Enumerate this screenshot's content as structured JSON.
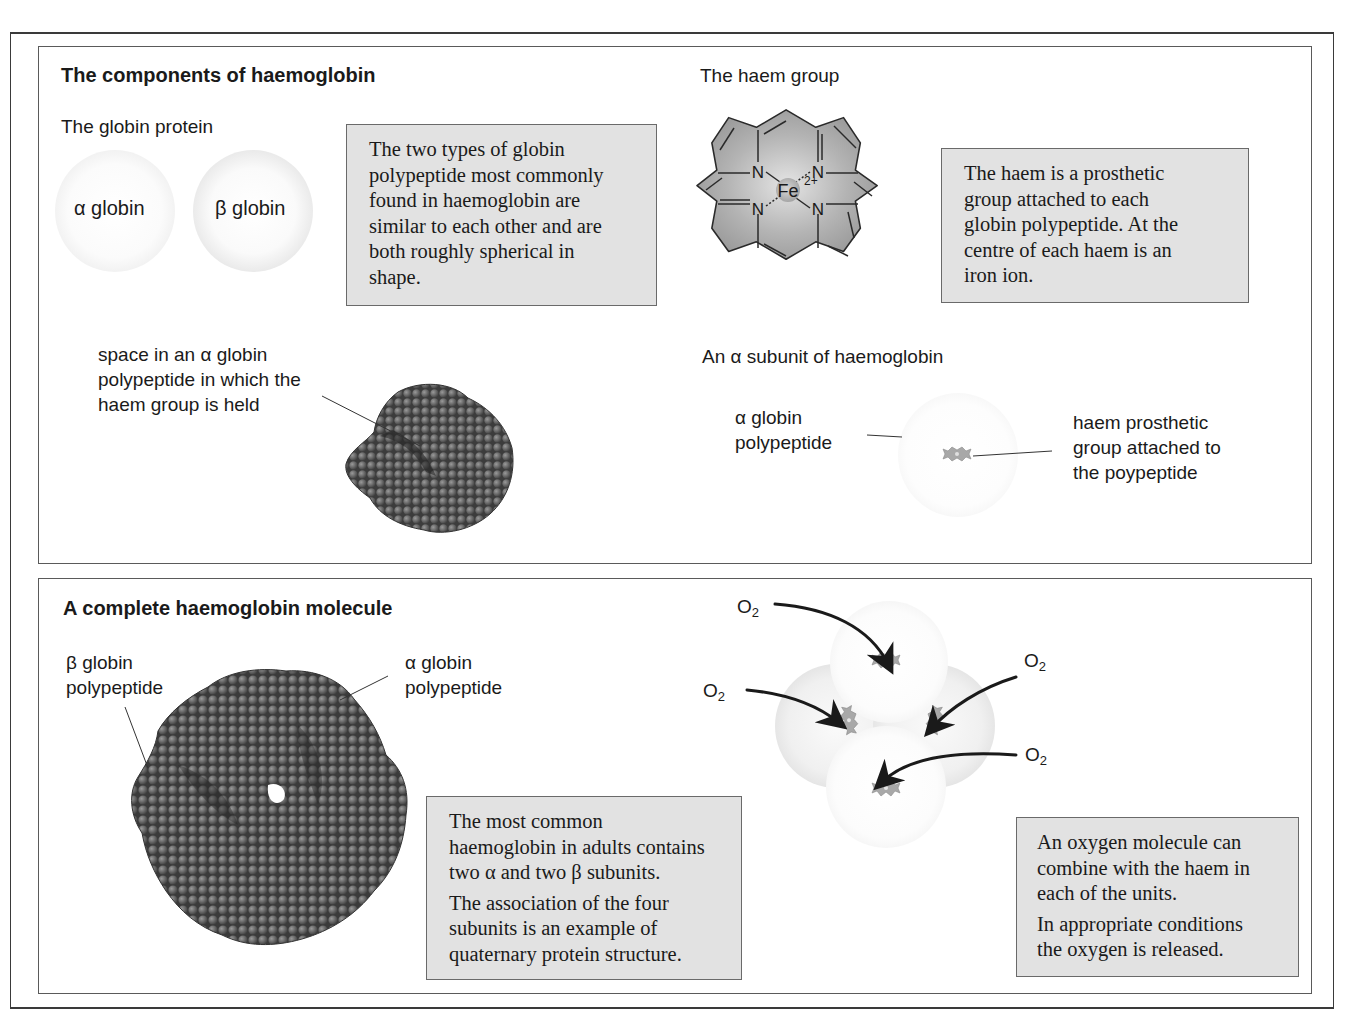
{
  "top_panel": {
    "title": "The components of haemoglobin",
    "globin_section": {
      "title": "The globin protein",
      "alpha_sphere_label": "α globin",
      "beta_sphere_label": "β globin",
      "note": "The two types of globin\npolypeptide most commonly\nfound in haemoglobin are\nsimilar to each other and are\nboth roughly spherical in\nshape."
    },
    "haem_section": {
      "title": "The haem group",
      "atoms": {
        "n": "N",
        "fe": "Fe",
        "charge": "2+"
      },
      "note": "The haem is a prosthetic\ngroup attached to each\nglobin polypeptide. At the\ncentre of each haem is an\niron ion."
    },
    "space_label": "space in an α globin\npolypeptide in which the\nhaem group is held",
    "subunit_section": {
      "title": "An α subunit of haemoglobin",
      "left_label": "α globin\npolypeptide",
      "right_label": "haem prosthetic\ngroup attached to\nthe poypeptide"
    }
  },
  "bottom_panel": {
    "title": "A complete haemoglobin molecule",
    "beta_label": "β globin\npolypeptide",
    "alpha_label": "α globin\npolypeptide",
    "note_1": "The most common\nhaemoglobin in adults contains\ntwo α and two β subunits.",
    "note_2": "The association of the four\nsubunits is an example of\nquaternary protein structure.",
    "oxygen_label": "O",
    "oxygen_subscript": "2",
    "oxygen_note_1": "An oxygen molecule can\ncombine with the haem in\neach of the units.",
    "oxygen_note_2": "In appropriate conditions\nthe oxygen is released."
  },
  "colors": {
    "note_fill": "#e2e2e2",
    "border": "#5a5a5a",
    "haem_fill": "#a8a8a8",
    "protein_dark": "#4a4a4a",
    "text": "#1a1a1a"
  }
}
